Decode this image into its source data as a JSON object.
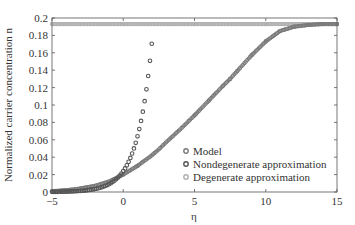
{
  "chart_data": {
    "type": "scatter",
    "title": "",
    "xlabel": "η",
    "ylabel": "Normalized carrier concentration n",
    "xlim": [
      -5,
      15
    ],
    "ylim": [
      0,
      0.2
    ],
    "xticks": [
      -5,
      0,
      5,
      10,
      15
    ],
    "xtick_labels": [
      "−5",
      "0",
      "5",
      "10",
      "15"
    ],
    "yticks": [
      0,
      0.02,
      0.04,
      0.06,
      0.08,
      0.1,
      0.12,
      0.14,
      0.16,
      0.18,
      0.2
    ],
    "ytick_labels": [
      "0",
      "0.02",
      "0.04",
      "0.06",
      "0.08",
      "0.1",
      "0.12",
      "0.14",
      "0.16",
      "0.18",
      "0.2"
    ],
    "grid": false,
    "legend_position": "lower right",
    "series": [
      {
        "name": "Model",
        "marker": "circle",
        "color": "#7a7a7a",
        "x": [
          -5,
          -4,
          -3,
          -2,
          -1,
          0,
          1,
          2,
          2.5,
          3,
          4,
          5,
          6,
          7,
          7.5,
          8,
          9,
          10,
          11,
          12,
          13,
          14,
          15
        ],
        "y": [
          0.001,
          0.002,
          0.004,
          0.007,
          0.012,
          0.02,
          0.03,
          0.042,
          0.049,
          0.057,
          0.072,
          0.088,
          0.105,
          0.122,
          0.13,
          0.139,
          0.157,
          0.173,
          0.185,
          0.19,
          0.192,
          0.193,
          0.193
        ]
      },
      {
        "name": "Nondegenerate approximation",
        "marker": "circle",
        "color": "#555555",
        "x": [
          -5,
          -4,
          -3,
          -2,
          -1,
          -0.5,
          0,
          0.25,
          0.5,
          0.75,
          1,
          1.25,
          1.5,
          1.75,
          2
        ],
        "y": [
          0.0002,
          0.0006,
          0.0016,
          0.0043,
          0.0115,
          0.018,
          0.024,
          0.031,
          0.04,
          0.052,
          0.067,
          0.086,
          0.11,
          0.138,
          0.17
        ]
      },
      {
        "name": "Degenerate approximation",
        "marker": "circle",
        "color": "#b0b0b0",
        "x": [
          -5,
          0,
          5,
          10,
          15
        ],
        "y": [
          0.193,
          0.193,
          0.193,
          0.193,
          0.193
        ]
      }
    ]
  },
  "legend": {
    "items": [
      {
        "label": "Model",
        "color": "#7a7a7a"
      },
      {
        "label": "Nondegenerate approximation",
        "color": "#555555"
      },
      {
        "label": "Degenerate approximation",
        "color": "#b0b0b0"
      }
    ]
  },
  "axes": {
    "xlabel": "η",
    "ylabel": "Normalized carrier concentration n"
  }
}
